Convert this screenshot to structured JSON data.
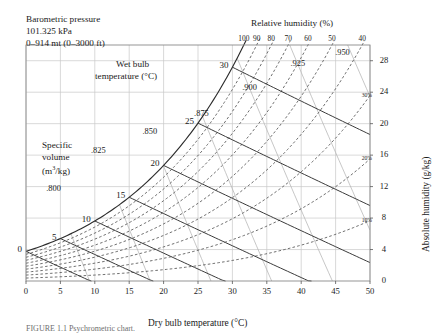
{
  "figure": {
    "header_lines": [
      "Barometric pressure",
      "101.325 kPa",
      "0–914 mt (0–3000 ft)"
    ],
    "caption": "FIGURE 1.1  Psychrometric chart."
  },
  "chart_data": {
    "type": "line",
    "title": "Psychrometric chart",
    "xlabel": "Dry bulb temperature (°C)",
    "ylabel": "Absolute humidity (g/kg)",
    "xlim": [
      0,
      50
    ],
    "ylim": [
      0,
      30
    ],
    "grid": true,
    "x_ticks": [
      0,
      5,
      10,
      15,
      20,
      25,
      30,
      35,
      40,
      45,
      50
    ],
    "x_tick_labels": [
      "0",
      "5",
      "10",
      "15",
      "20",
      "25",
      "30",
      "35",
      "40",
      "45",
      "50"
    ],
    "y_ticks": [
      0,
      4,
      8,
      12,
      16,
      20,
      24,
      28
    ],
    "y_tick_labels": [
      "0",
      "4",
      "8",
      "12",
      "16",
      "20",
      "24",
      "28"
    ],
    "pressure_kpa": 101.325,
    "series": [
      {
        "name": "Relative humidity (%)",
        "style": "dashed",
        "color": "#4a4a4a",
        "top_label": "Relative humidity (%)",
        "values": [
          100,
          90,
          80,
          70,
          60,
          50,
          40,
          30,
          20,
          10
        ],
        "top_labelled": [
          100,
          90,
          80,
          70,
          60,
          50,
          40
        ],
        "top_label_text": [
          "100",
          "90",
          "80",
          "70",
          "60",
          "50",
          "40"
        ],
        "side_labelled": [
          30,
          20,
          10
        ],
        "side_label_text": [
          "30%",
          "20%",
          "10%"
        ]
      },
      {
        "name": "Wet bulb temperature (°C)",
        "style": "solid",
        "color": "#3b3b3b",
        "axis_label": "Wet bulb temperature (°C)",
        "values": [
          0,
          5,
          10,
          15,
          20,
          25,
          30
        ],
        "labels": [
          "0",
          "5",
          "10",
          "15",
          "20",
          "25",
          "30"
        ]
      },
      {
        "name": "Specific volume (m3/kg)",
        "style": "solid-light",
        "color": "#b4b4b4",
        "axis_label_lines": [
          "Specific",
          "volume",
          "(m",
          "3",
          "/kg)"
        ],
        "values": [
          0.8,
          0.825,
          0.85,
          0.875,
          0.9,
          0.925,
          0.95
        ],
        "labels": [
          ".800",
          ".825",
          ".850",
          ".875",
          ".900",
          ".925",
          ".950"
        ]
      }
    ]
  },
  "axes": {
    "x_title": "Dry bulb temperature (°C)",
    "y_title": "Absolute humidity (g/kg)",
    "rh_title": "Relative humidity (%)",
    "wb_title_lines": [
      "Wet bulb",
      "temperature (°C)"
    ],
    "sv_title_lines": [
      "Specific",
      "volume",
      "(m",
      "/kg)"
    ],
    "sv_exponent": "3"
  }
}
